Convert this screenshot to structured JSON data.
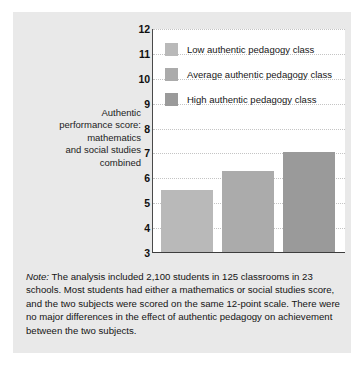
{
  "chart_data": {
    "type": "bar",
    "title": "",
    "xlabel": "",
    "ylabel": "Authentic performance score: mathematics and social studies combined",
    "ylim": [
      3,
      12
    ],
    "ytick_labels": [
      "12",
      "11",
      "10",
      "9",
      "8",
      "7",
      "6",
      "5",
      "4",
      "3"
    ],
    "yticks": [
      12,
      11,
      10,
      9,
      8,
      7,
      6,
      5,
      4,
      3
    ],
    "grid": true,
    "legend_position": "upper-left-inside",
    "categories": [
      "Low authentic pedagogy class",
      "Average authentic pedagogy class",
      "High authentic pedagogy class"
    ],
    "values": [
      5.5,
      6.25,
      7.0
    ],
    "bar_colors": [
      "#b9b9b9",
      "#ababab",
      "#9a9a9a"
    ]
  },
  "axis_title": {
    "lines": [
      "Authentic",
      "performance score:",
      "mathematics",
      "and social studies",
      "combined"
    ]
  },
  "legend": {
    "items": [
      {
        "label": "Low authentic pedagogy class",
        "color": "#b9b9b9"
      },
      {
        "label": "Average authentic pedagogy class",
        "color": "#ababab"
      },
      {
        "label": "High authentic pedagogy class",
        "color": "#9a9a9a"
      }
    ]
  },
  "note": {
    "label": "Note:",
    "text": " The analysis included 2,100 students in 125 classrooms in 23 schools. Most students had either a mathematics or social studies score, and the two subjects were scored on the same 12-point scale. There were no major differences in the effect of authentic pedagogy on achievement between the two subjects."
  },
  "colors": {
    "panel_background": "#e9e9e9",
    "plot_background": "#ffffff",
    "axis_line": "#3d3d3d",
    "gridline": "#c4c4c4",
    "text": "#141414"
  }
}
